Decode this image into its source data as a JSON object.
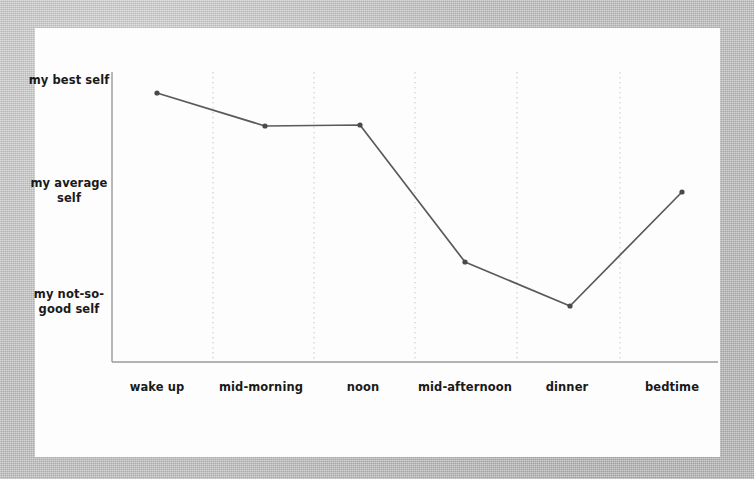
{
  "chart_data": {
    "type": "line",
    "title": "",
    "subtitle": "",
    "xlabel": "",
    "ylabel": "",
    "grid": true,
    "legend": false,
    "legend_position": "none",
    "line_color": "#5a5a5a",
    "marker_color": "#4a4a4a",
    "axis_color": "#9a9a9a",
    "gridline_color": "#c9c9c9",
    "background_color": "#bcbcbc",
    "card_color": "#fdfdfd",
    "text_color": "#1a1a1a",
    "categories": [
      "wake up",
      "mid-morning",
      "noon",
      "mid-afternoon",
      "dinner",
      "bedtime"
    ],
    "x": [
      0,
      1,
      2,
      3,
      4,
      5
    ],
    "ytick_labels": [
      "my best self",
      "my average self",
      "my not-so-good self"
    ],
    "ytick_values": [
      3,
      2,
      1
    ],
    "ylim": [
      0.45,
      3.25
    ],
    "values": [
      3.0,
      2.7,
      2.71,
      1.45,
      1.05,
      2.08
    ],
    "series": [
      {
        "name": "energy level",
        "values": [
          3.0,
          2.7,
          2.71,
          1.45,
          1.05,
          2.08
        ]
      }
    ],
    "points": [
      {
        "category": "wake up",
        "label": "my best self",
        "value": 3.0,
        "px": 157,
        "py": 93
      },
      {
        "category": "mid-morning",
        "label": "",
        "value": 2.7,
        "px": 265,
        "py": 126
      },
      {
        "category": "noon",
        "label": "",
        "value": 2.71,
        "px": 360,
        "py": 125
      },
      {
        "category": "mid-afternoon",
        "label": "",
        "value": 1.45,
        "px": 465,
        "py": 262
      },
      {
        "category": "dinner",
        "label": "my not-so-good self",
        "value": 1.05,
        "px": 570,
        "py": 306
      },
      {
        "category": "bedtime",
        "label": "",
        "value": 2.08,
        "px": 682,
        "py": 192
      }
    ],
    "gridlines_px": [
      213,
      314,
      415,
      517,
      620
    ],
    "axes_px": {
      "x_left": 112,
      "x_right": 718,
      "y_top": 72,
      "y_bottom": 362
    }
  },
  "yaxis": {
    "ticks": [
      {
        "text": "my best self",
        "top": 73,
        "left": 26
      },
      {
        "text": "my average self",
        "top": 176,
        "left": 26
      },
      {
        "text": "my not-so-good self",
        "top": 287,
        "left": 26
      }
    ]
  },
  "xaxis": {
    "ticks": [
      {
        "text": "wake up",
        "left": 99,
        "top": 380
      },
      {
        "text": "mid-morning",
        "left": 203,
        "top": 380
      },
      {
        "text": "noon",
        "left": 305,
        "top": 380
      },
      {
        "text": "mid-afternoon",
        "left": 407,
        "top": 380
      },
      {
        "text": "dinner",
        "left": 509,
        "top": 380
      },
      {
        "text": "bedtime",
        "left": 614,
        "top": 380
      }
    ]
  }
}
